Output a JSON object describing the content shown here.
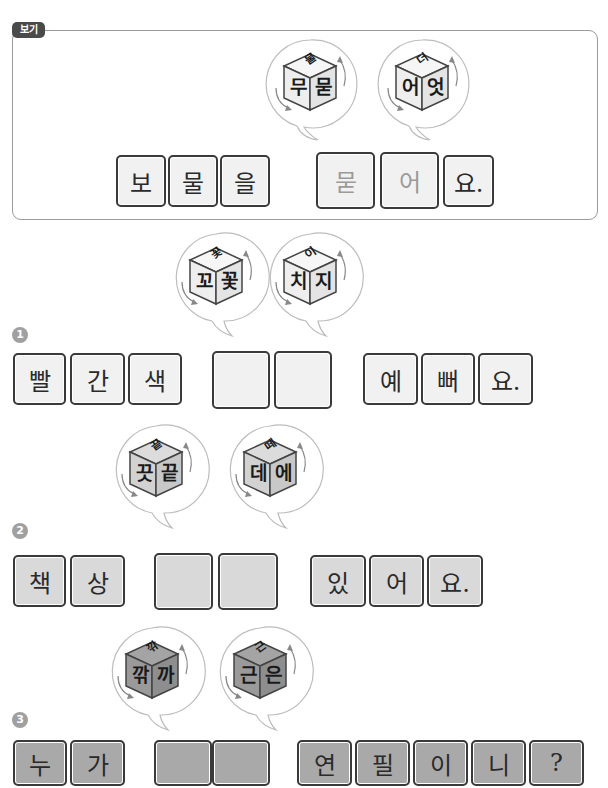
{
  "example": {
    "badge": "보기",
    "dice": [
      {
        "top": "물",
        "left": "무",
        "right": "묻",
        "shade": "light"
      },
      {
        "top": "더",
        "left": "어",
        "right": "엇",
        "shade": "light"
      }
    ],
    "tiles": [
      "보",
      "물",
      "을",
      "묻",
      "어",
      "요."
    ]
  },
  "problems": [
    {
      "number": "1",
      "dice": [
        {
          "top": "꽃",
          "left": "꼬",
          "right": "꽃",
          "shade": "light"
        },
        {
          "top": "이",
          "left": "치",
          "right": "지",
          "shade": "light"
        }
      ],
      "before": [
        "빨",
        "간",
        "색"
      ],
      "blanks": [
        "",
        ""
      ],
      "after": [
        "예",
        "뻐",
        "요."
      ]
    },
    {
      "number": "2",
      "dice": [
        {
          "top": "끝",
          "left": "끗",
          "right": "끝",
          "shade": "mid"
        },
        {
          "top": "떼",
          "left": "데",
          "right": "에",
          "shade": "mid"
        }
      ],
      "before": [
        "책",
        "상"
      ],
      "blanks": [
        "",
        ""
      ],
      "after": [
        "있",
        "어",
        "요."
      ]
    },
    {
      "number": "3",
      "dice": [
        {
          "top": "깎",
          "left": "깎",
          "right": "까",
          "shade": "dark"
        },
        {
          "top": "근",
          "left": "근",
          "right": "은",
          "shade": "dark"
        }
      ],
      "before": [
        "누",
        "가"
      ],
      "blanks": [
        "",
        ""
      ],
      "after": [
        "연",
        "필",
        "이",
        "니",
        "?"
      ]
    }
  ],
  "colors": {
    "tile_light": "#f1f1f1",
    "tile_mid": "#d9d9d9",
    "tile_dark": "#a9a9a9",
    "tile_border": "#3a3a3a",
    "answer_text": "#9a9a9a",
    "badge_bg": "#4a4a4a",
    "number_bg": "#a0a0a0"
  }
}
